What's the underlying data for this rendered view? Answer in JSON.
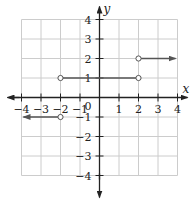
{
  "chart_data": {
    "type": "line",
    "title": "",
    "xlabel": "x",
    "ylabel": "y",
    "xlim": [
      -4,
      4
    ],
    "ylim": [
      -4,
      4
    ],
    "grid": true,
    "x_ticks": [
      -4,
      -3,
      -2,
      -1,
      1,
      2,
      3,
      4
    ],
    "y_ticks": [
      -4,
      -3,
      -2,
      -1,
      1,
      2,
      3,
      4
    ],
    "origin_label": "0",
    "series": [
      {
        "name": "segment-left",
        "y": -1,
        "x_from": -4,
        "x_to": -2,
        "left_end": "arrow",
        "right_end": "open"
      },
      {
        "name": "segment-middle",
        "y": 1,
        "x_from": -2,
        "x_to": 2,
        "left_end": "open",
        "right_end": "open"
      },
      {
        "name": "segment-right",
        "y": 2,
        "x_from": 2,
        "x_to": 4,
        "left_end": "open",
        "right_end": "arrow"
      }
    ],
    "colors": {
      "grid": "#cccccc",
      "axis": "#222222",
      "graph": "#555555"
    }
  }
}
